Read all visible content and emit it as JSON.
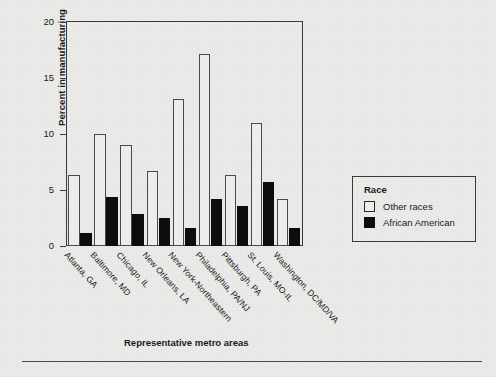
{
  "chart_data": {
    "type": "bar",
    "title": "",
    "xlabel": "Representative metro areas",
    "ylabel": "Percent in manufacturing",
    "ylim": [
      0,
      20
    ],
    "yticks": [
      0,
      5,
      10,
      15,
      20
    ],
    "ytick_labels": [
      "0",
      "5",
      "10",
      "15",
      "20"
    ],
    "grid": false,
    "legend_position": "right",
    "legend_title": "Race",
    "categories": [
      "Atlanta, GA",
      "Baltimore, MD",
      "Chicago, IL",
      "New Orleans, LA",
      "New York-Northeastern",
      "Philadelphia, PA/NJ",
      "Pittsburgh, PA",
      "St. Louis, MO-IL",
      "Washington, DC/MD/VA"
    ],
    "series": [
      {
        "name": "Other races",
        "color": "#ffffff",
        "values": [
          6.3,
          10.0,
          9.0,
          6.7,
          13.1,
          17.1,
          6.3,
          11.0,
          4.2
        ]
      },
      {
        "name": "African American",
        "color": "#000000",
        "values": [
          1.2,
          4.4,
          2.9,
          2.5,
          1.6,
          4.2,
          3.6,
          5.7,
          1.6
        ]
      }
    ]
  },
  "legend": {
    "title": "Race",
    "entries": [
      {
        "label": "Other races",
        "swatch": "other"
      },
      {
        "label": "African American",
        "swatch": "aa"
      }
    ]
  }
}
